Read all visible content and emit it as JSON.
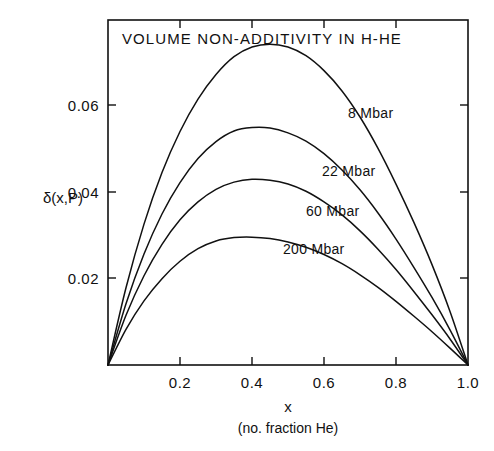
{
  "chart_data": {
    "type": "line",
    "title": "VOLUME NON-ADDITIVITY IN H-HE",
    "xlabel": "x",
    "xlabel_sub": "(no. fraction He)",
    "ylabel": "δ(x,P)",
    "xlim": [
      0.0,
      1.0
    ],
    "ylim": [
      0.0,
      0.0715
    ],
    "grid": false,
    "legend_position": "inline-curve-labels",
    "xticks": [
      0.0,
      0.2,
      0.4,
      0.6,
      0.8,
      1.0
    ],
    "xtick_labels": [
      "",
      "0.2",
      "0.4",
      "0.6",
      "0.8",
      "1.0"
    ],
    "yticks": [
      0.02,
      0.04,
      0.06
    ],
    "ytick_labels": [
      "0.02",
      "0.04",
      "0.06"
    ],
    "series": [
      {
        "name": "8 Mbar",
        "label": "8 Mbar",
        "peak_x": 0.45,
        "peak_y": 0.0665,
        "x": [
          0.0,
          0.05,
          0.1,
          0.15,
          0.2,
          0.25,
          0.3,
          0.35,
          0.4,
          0.45,
          0.5,
          0.55,
          0.6,
          0.65,
          0.7,
          0.75,
          0.8,
          0.85,
          0.9,
          0.95,
          1.0
        ],
        "values": [
          0.0,
          0.016,
          0.0292,
          0.0399,
          0.0484,
          0.0551,
          0.0602,
          0.0639,
          0.0659,
          0.0665,
          0.0659,
          0.0641,
          0.061,
          0.0568,
          0.0514,
          0.0449,
          0.0375,
          0.0295,
          0.0208,
          0.0111,
          0.0
        ]
      },
      {
        "name": "22 Mbar",
        "label": "22 Mbar",
        "peak_x": 0.43,
        "peak_y": 0.0492,
        "x": [
          0.0,
          0.05,
          0.1,
          0.15,
          0.2,
          0.25,
          0.3,
          0.35,
          0.4,
          0.45,
          0.5,
          0.55,
          0.6,
          0.65,
          0.7,
          0.75,
          0.8,
          0.85,
          0.9,
          0.95,
          1.0
        ],
        "values": [
          0.0,
          0.0127,
          0.023,
          0.0313,
          0.0378,
          0.0428,
          0.0463,
          0.0485,
          0.0492,
          0.0491,
          0.0481,
          0.0464,
          0.0438,
          0.0404,
          0.0363,
          0.0315,
          0.0261,
          0.0202,
          0.014,
          0.0073,
          0.0
        ]
      },
      {
        "name": "60 Mbar",
        "label": "60 Mbar",
        "peak_x": 0.42,
        "peak_y": 0.0385,
        "x": [
          0.0,
          0.05,
          0.1,
          0.15,
          0.2,
          0.25,
          0.3,
          0.35,
          0.4,
          0.45,
          0.5,
          0.55,
          0.6,
          0.65,
          0.7,
          0.75,
          0.8,
          0.85,
          0.9,
          0.95,
          1.0
        ],
        "values": [
          0.0,
          0.0103,
          0.0185,
          0.025,
          0.0301,
          0.0338,
          0.0364,
          0.0379,
          0.0385,
          0.0383,
          0.0375,
          0.036,
          0.0338,
          0.0311,
          0.0278,
          0.024,
          0.0198,
          0.0152,
          0.0104,
          0.0054,
          0.0
        ]
      },
      {
        "name": "200 Mbar",
        "label": "200 Mbar",
        "peak_x": 0.4,
        "peak_y": 0.0265,
        "x": [
          0.0,
          0.05,
          0.1,
          0.15,
          0.2,
          0.25,
          0.3,
          0.35,
          0.4,
          0.45,
          0.5,
          0.55,
          0.6,
          0.65,
          0.7,
          0.75,
          0.8,
          0.85,
          0.9,
          0.95,
          1.0
        ],
        "values": [
          0.0,
          0.0074,
          0.0133,
          0.0179,
          0.0215,
          0.0241,
          0.0257,
          0.0264,
          0.0265,
          0.0262,
          0.0255,
          0.0244,
          0.0229,
          0.021,
          0.0187,
          0.0161,
          0.0132,
          0.0101,
          0.0069,
          0.0035,
          0.0
        ]
      }
    ]
  },
  "annotations": {
    "curve_label_0": "8 Mbar",
    "curve_label_1": "22 Mbar",
    "curve_label_2": "60 Mbar",
    "curve_label_3": "200 Mbar"
  }
}
